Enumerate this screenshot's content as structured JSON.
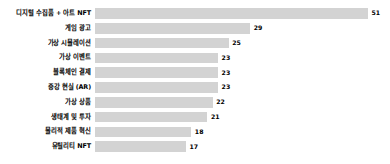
{
  "chart_data": {
    "type": "bar",
    "orientation": "horizontal",
    "title": "",
    "subtitle": "",
    "xlabel": "",
    "ylabel": "",
    "grid": false,
    "legend": null,
    "legend_position": "none",
    "xlim": [
      0,
      51
    ],
    "bar_color": "#d3d3d3",
    "value_label_color": "#000000",
    "category_label_color": "#000000",
    "categories": [
      "디지털 수집품 + 아트 NFT",
      "게임 광고",
      "가상 시뮬레이션",
      "가상 이벤트",
      "블록체인 결제",
      "증강 현실 (AR)",
      "가상 상품",
      "생태계 및 투자",
      "물리적 제품 혁신",
      "유틸리티 NFT"
    ],
    "values": [
      51,
      29,
      25,
      23,
      23,
      23,
      22,
      21,
      18,
      17
    ],
    "value_labels": [
      "51",
      "29",
      "25",
      "23",
      "23",
      "23",
      "22",
      "21",
      "18",
      "17"
    ]
  }
}
